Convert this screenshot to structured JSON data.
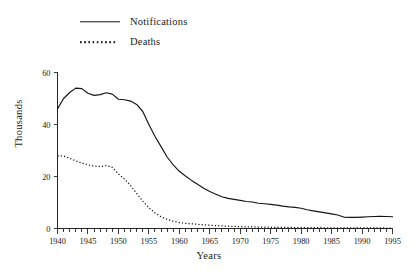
{
  "chart_data": {
    "type": "line",
    "title": "",
    "xlabel": "Years",
    "ylabel": "Thousands",
    "xlim": [
      1940,
      1995
    ],
    "ylim": [
      0,
      60
    ],
    "yticks": [
      0,
      20,
      40,
      60
    ],
    "xticks": [
      1940,
      1945,
      1950,
      1955,
      1960,
      1965,
      1970,
      1975,
      1980,
      1985,
      1990,
      1995
    ],
    "minor_tick_interval": 1,
    "grid": false,
    "legend_position": "top-left",
    "x": [
      1940,
      1941,
      1942,
      1943,
      1944,
      1945,
      1946,
      1947,
      1948,
      1949,
      1950,
      1951,
      1952,
      1953,
      1954,
      1955,
      1956,
      1957,
      1958,
      1959,
      1960,
      1961,
      1962,
      1963,
      1964,
      1965,
      1966,
      1967,
      1968,
      1969,
      1970,
      1971,
      1972,
      1973,
      1974,
      1975,
      1976,
      1977,
      1978,
      1979,
      1980,
      1981,
      1982,
      1983,
      1984,
      1985,
      1986,
      1987,
      1988,
      1989,
      1990,
      1991,
      1992,
      1993,
      1994,
      1995
    ],
    "series": [
      {
        "name": "Notifications",
        "style": "solid",
        "color": "#141414",
        "values": [
          46.0,
          50.0,
          52.3,
          54.0,
          53.8,
          52.0,
          51.2,
          51.5,
          52.2,
          51.7,
          49.7,
          49.5,
          49.0,
          47.7,
          45.0,
          40.0,
          35.5,
          31.5,
          27.5,
          24.5,
          22.0,
          20.2,
          18.5,
          17.0,
          15.5,
          14.2,
          13.2,
          12.2,
          11.6,
          11.2,
          10.8,
          10.4,
          10.2,
          9.7,
          9.5,
          9.3,
          9.0,
          8.6,
          8.3,
          8.1,
          7.8,
          7.2,
          6.8,
          6.4,
          6.0,
          5.6,
          5.2,
          4.4,
          4.3,
          4.3,
          4.4,
          4.5,
          4.6,
          4.7,
          4.6,
          4.5
        ]
      },
      {
        "name": "Deaths",
        "style": "dotted",
        "color": "#141414",
        "values": [
          28.0,
          27.9,
          27.0,
          26.0,
          25.2,
          24.5,
          24.0,
          23.8,
          24.2,
          23.5,
          21.0,
          19.0,
          16.5,
          13.5,
          10.5,
          8.0,
          6.0,
          4.5,
          3.5,
          2.8,
          2.3,
          2.0,
          1.8,
          1.6,
          1.4,
          1.3,
          1.1,
          1.0,
          0.9,
          0.8,
          0.7,
          0.65,
          0.6,
          0.55,
          0.5,
          0.48,
          0.45,
          0.42,
          0.4,
          0.38,
          0.36,
          0.34,
          0.32,
          0.3,
          0.28,
          0.27,
          0.26,
          0.25,
          0.24,
          0.23,
          0.22,
          0.21,
          0.2,
          0.2,
          0.19,
          0.18
        ]
      }
    ]
  },
  "legend": {
    "items": [
      {
        "label": "Notifications",
        "key": "solid-line-key"
      },
      {
        "label": "Deaths",
        "key": "dotted-line-key"
      }
    ]
  },
  "axes": {
    "y_title": "Thousands",
    "x_title": "Years",
    "y_tick_labels": [
      "0",
      "20",
      "40",
      "60"
    ],
    "x_tick_labels": [
      "1940",
      "1945",
      "1950",
      "1955",
      "1960",
      "1965",
      "1970",
      "1975",
      "1980",
      "1985",
      "1990",
      "1995"
    ]
  }
}
